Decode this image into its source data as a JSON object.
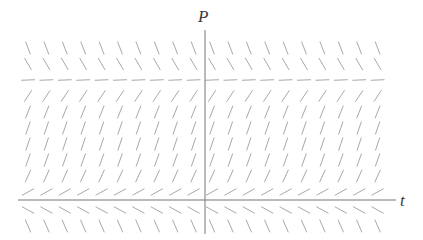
{
  "figure": {
    "type": "slope-field",
    "background_color": "#ffffff",
    "axis_color": "#777777",
    "tick_color": "#a8a8a8",
    "label_color": "#3a3a3a"
  },
  "axes": {
    "vertical": {
      "label": "P",
      "name": "P-axis",
      "x": 205,
      "y_start": 30,
      "y_end": 234,
      "label_x": 198,
      "label_y": 8
    },
    "horizontal": {
      "label": "t",
      "name": "t-axis",
      "y": 200,
      "x_start": 18,
      "x_end": 396,
      "label_x": 400,
      "label_y": 192
    }
  },
  "chart_data": {
    "type": "scatter",
    "title": "",
    "xlabel": "t",
    "ylabel": "P",
    "grid": false,
    "legend": null,
    "xlim": [
      18,
      396
    ],
    "ylim": [
      30,
      234
    ],
    "field": {
      "x_start": 28,
      "x_spacing": 18.4,
      "n_cols": 20,
      "segment_length": 13,
      "stroke_color": "#a8a8a8",
      "stroke_width": 1.0,
      "rows": [
        {
          "y": 48,
          "slope": -2.6,
          "note": "steeply decreasing, far above equilibrium"
        },
        {
          "y": 64,
          "slope": -1.7,
          "note": "decreasing, above equilibrium"
        },
        {
          "y": 80,
          "slope": 0.04,
          "note": "equilibrium line, nearly zero slope"
        },
        {
          "y": 96,
          "slope": 1.5,
          "note": "increasing toward equilibrium"
        },
        {
          "y": 112,
          "slope": 2.5,
          "note": "steeply increasing"
        },
        {
          "y": 128,
          "slope": 2.9,
          "note": "steeply increasing"
        },
        {
          "y": 144,
          "slope": 3.0,
          "note": "steeply increasing"
        },
        {
          "y": 160,
          "slope": 2.8,
          "note": "steeply increasing"
        },
        {
          "y": 176,
          "slope": 2.2,
          "note": "increasing"
        },
        {
          "y": 192,
          "slope": 0.55,
          "note": "shallow increase just above t-axis"
        },
        {
          "y": 210,
          "slope": -0.55,
          "note": "shallow decrease just below t-axis"
        },
        {
          "y": 226,
          "slope": -2.3,
          "note": "steeply decreasing below t-axis"
        }
      ]
    }
  }
}
